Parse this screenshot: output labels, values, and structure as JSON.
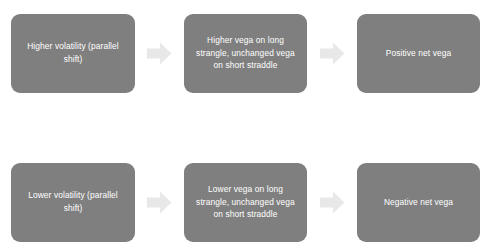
{
  "diagram": {
    "background_color": "#ffffff",
    "node_fill_color": "#7f7f7f",
    "node_text_color": "#ffffff",
    "arrow_color": "#e8e8e8",
    "rows": [
      {
        "id": "higher-volatility-flow",
        "nodes": [
          {
            "id": "node-higher-volatility",
            "text": "Higher volatility (parallel shift)"
          },
          {
            "id": "node-higher-vega",
            "text": "Higher vega on long strangle, unchanged vega on short straddle"
          },
          {
            "id": "node-positive-net-vega",
            "text": "Positive net vega"
          }
        ],
        "arrows": [
          {
            "id": "arrow-higher-1",
            "icon": "arrow-right-icon"
          },
          {
            "id": "arrow-higher-2",
            "icon": "arrow-right-icon"
          }
        ]
      },
      {
        "id": "lower-volatility-flow",
        "nodes": [
          {
            "id": "node-lower-volatility",
            "text": "Lower volatility (parallel shift)"
          },
          {
            "id": "node-lower-vega",
            "text": "Lower vega on long strangle, unchanged vega on short straddle"
          },
          {
            "id": "node-negative-net-vega",
            "text": "Negative net vega"
          }
        ],
        "arrows": [
          {
            "id": "arrow-lower-1",
            "icon": "arrow-right-icon"
          },
          {
            "id": "arrow-lower-2",
            "icon": "arrow-right-icon"
          }
        ]
      }
    ]
  }
}
